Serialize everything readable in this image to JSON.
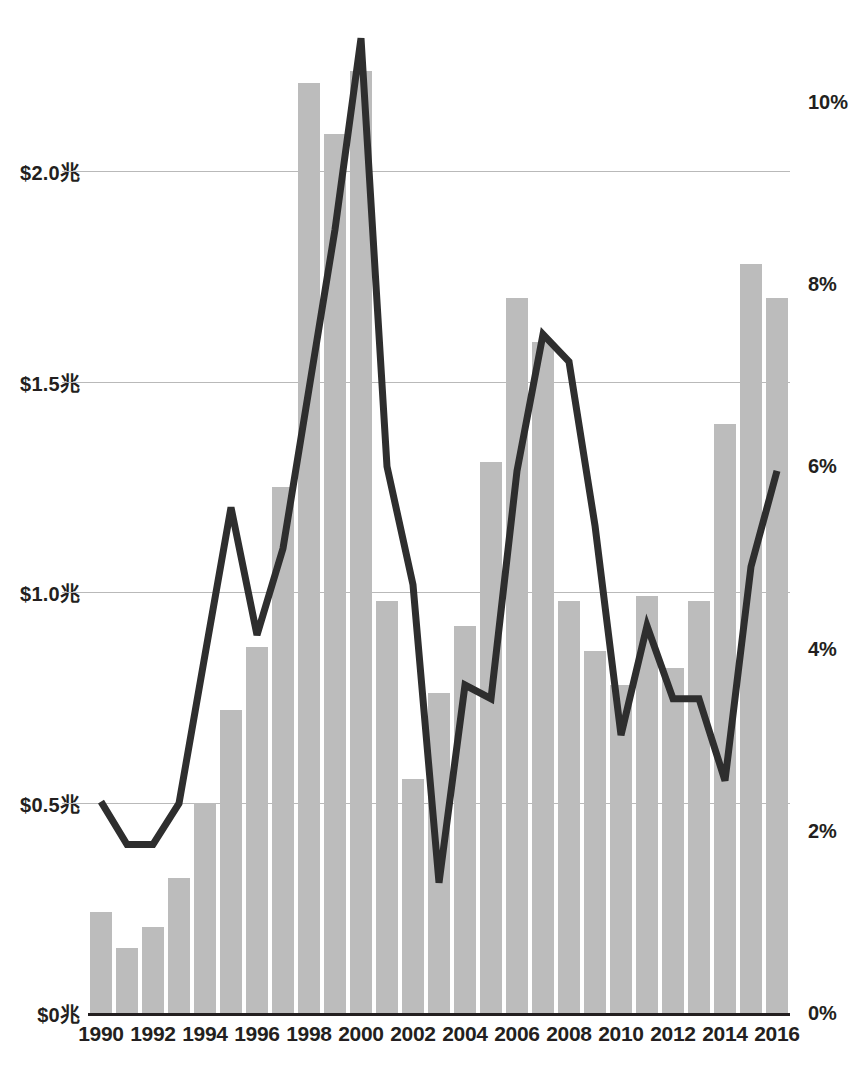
{
  "chart_data": {
    "type": "bar",
    "title": "",
    "subtitle": "",
    "xlabel": "",
    "ylabel": "",
    "grid": true,
    "legend": "none",
    "x": [
      1990,
      1991,
      1992,
      1993,
      1994,
      1995,
      1996,
      1997,
      1998,
      1999,
      2000,
      2001,
      2002,
      2003,
      2004,
      2005,
      2006,
      2007,
      2008,
      2009,
      2010,
      2011,
      2012,
      2013,
      2014,
      2015,
      2016
    ],
    "categories": [
      "1990",
      "1991",
      "1992",
      "1993",
      "1994",
      "1995",
      "1996",
      "1997",
      "1998",
      "1999",
      "2000",
      "2001",
      "2002",
      "2003",
      "2004",
      "2005",
      "2006",
      "2007",
      "2008",
      "2009",
      "2010",
      "2011",
      "2012",
      "2013",
      "2014",
      "2015",
      "2016"
    ],
    "x_tick_labels": [
      "1990",
      "1992",
      "1994",
      "1996",
      "1998",
      "2000",
      "2002",
      "2004",
      "2006",
      "2008",
      "2010",
      "2012",
      "2014",
      "2016"
    ],
    "left_axis": {
      "label": "",
      "tick_labels": [
        "$0兆",
        "$0.5兆",
        "$1.0兆",
        "$1.5兆",
        "$2.0兆"
      ],
      "tick_values": [
        0,
        0.5,
        1.0,
        1.5,
        2.0
      ],
      "ylim": [
        0,
        2.36
      ],
      "unit": "兆"
    },
    "right_axis": {
      "label": "",
      "tick_labels": [
        "0%",
        "2%",
        "4%",
        "6%",
        "8%",
        "10%"
      ],
      "tick_values": [
        0,
        2,
        4,
        6,
        8,
        10
      ],
      "ylim": [
        0,
        10.9
      ],
      "unit": "%"
    },
    "series": [
      {
        "name": "bars",
        "type": "bar",
        "axis": "left",
        "color": "#bcbcbc",
        "values": [
          0.24,
          0.155,
          0.205,
          0.32,
          0.5,
          0.72,
          0.87,
          1.25,
          2.21,
          2.09,
          2.24,
          0.98,
          0.555,
          0.76,
          0.92,
          1.31,
          1.7,
          1.595,
          0.98,
          0.86,
          0.78,
          0.99,
          0.82,
          0.98,
          1.4,
          1.78,
          1.7
        ]
      },
      {
        "name": "line",
        "type": "line",
        "axis": "right",
        "color": "#2e2e2e",
        "values": [
          2.32,
          1.85,
          1.85,
          2.3,
          3.93,
          5.55,
          4.15,
          5.1,
          6.85,
          8.6,
          10.7,
          6.0,
          4.7,
          1.43,
          3.6,
          3.45,
          5.95,
          7.45,
          7.15,
          5.35,
          3.05,
          4.25,
          3.45,
          3.45,
          2.55,
          4.9,
          5.95
        ]
      }
    ]
  },
  "caption": {
    "text": ""
  }
}
